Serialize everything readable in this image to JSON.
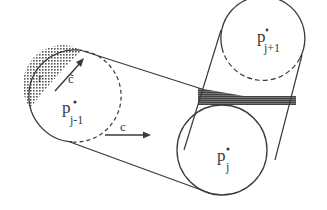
{
  "figure": {
    "type": "tube-of-circles diagram",
    "circles": [
      {
        "id": "prev",
        "label": "p",
        "superscript": "*",
        "subscript": "j-1"
      },
      {
        "id": "curr",
        "label": "p",
        "superscript": "*",
        "subscript": "j"
      },
      {
        "id": "next",
        "label": "p",
        "superscript": "*",
        "subscript": "j+1"
      }
    ],
    "vectors": [
      {
        "id": "c-tilde",
        "label": "c̃"
      },
      {
        "id": "c",
        "label": "c"
      }
    ],
    "region_label": "r",
    "colors": {
      "ink": "#3a3a3a",
      "hatch": "#555555",
      "background": "#ffffff"
    }
  }
}
